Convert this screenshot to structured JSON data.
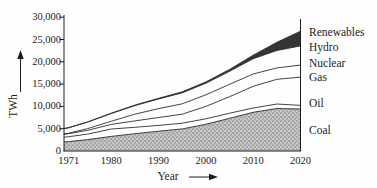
{
  "figure": {
    "xlabel": "Year",
    "ylabel": "TWh"
  },
  "chart_data": {
    "type": "area",
    "stacked": true,
    "title": "",
    "xlabel": "Year",
    "ylabel": "TWh",
    "xlim": [
      1970,
      2020
    ],
    "ylim": [
      0,
      30000
    ],
    "grid": false,
    "legend_position": "right-outside",
    "x": [
      1970,
      1971,
      1975,
      1980,
      1985,
      1990,
      1995,
      2000,
      2005,
      2010,
      2015,
      2020
    ],
    "series": [
      {
        "name": "Coal",
        "values": [
          2050,
          2100,
          2550,
          3270,
          3880,
          4430,
          4950,
          5990,
          7330,
          8670,
          9540,
          9420
        ]
      },
      {
        "name": "Oil",
        "values": [
          1050,
          1100,
          1250,
          1660,
          1440,
          1320,
          1290,
          1240,
          1150,
          980,
          990,
          800
        ]
      },
      {
        "name": "Gas",
        "values": [
          650,
          690,
          850,
          1040,
          1440,
          1750,
          2020,
          2770,
          3700,
          4850,
          5540,
          6340
        ]
      },
      {
        "name": "Nuclear",
        "values": [
          80,
          110,
          370,
          710,
          1480,
          2010,
          2330,
          2590,
          2770,
          2760,
          2570,
          2700
        ]
      },
      {
        "name": "Hydro",
        "values": [
          1180,
          1210,
          1460,
          1720,
          1950,
          2140,
          2460,
          2620,
          2930,
          3440,
          3890,
          4300
        ]
      },
      {
        "name": "Renewables",
        "values": [
          30,
          40,
          50,
          70,
          100,
          170,
          220,
          290,
          420,
          770,
          1850,
          3310
        ]
      }
    ],
    "yticks": [
      0,
      5000,
      10000,
      15000,
      20000,
      25000,
      30000
    ],
    "ytick_labels": [
      "0",
      "5,000",
      "10,000",
      "15,000",
      "20,000",
      "25,000",
      "30,000"
    ],
    "xticks": [
      1971,
      1980,
      1990,
      2000,
      2010,
      2020
    ],
    "xtick_labels": [
      "1971",
      "1980",
      "1990",
      "2000",
      "2010",
      "2020"
    ],
    "colors": {
      "line": "#2e2e2e",
      "coal_fill_base": "#c9c9c9",
      "coal_fill_dot": "#848484",
      "renewables_fill": "#343434",
      "background": "#fefefe",
      "text": "#1c1c1c"
    }
  }
}
